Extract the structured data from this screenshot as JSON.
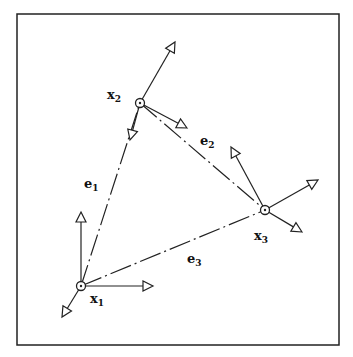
{
  "diagram": {
    "frame": {
      "x": 17,
      "y": 14,
      "w": 322,
      "h": 331
    },
    "nodes": [
      {
        "id": "x1",
        "label": "x",
        "sub": "1",
        "x": 81,
        "y": 286,
        "lx": 90,
        "ly": 303
      },
      {
        "id": "x2",
        "label": "x",
        "sub": "2",
        "x": 140,
        "y": 103,
        "lx": 107,
        "ly": 99
      },
      {
        "id": "x3",
        "label": "x",
        "sub": "3",
        "x": 265,
        "y": 210,
        "lx": 254,
        "ly": 240
      }
    ],
    "edges": [
      {
        "id": "e1",
        "label": "e",
        "sub": "1",
        "from": "x1",
        "to": "x2",
        "lx": 84,
        "ly": 188
      },
      {
        "id": "e2",
        "label": "e",
        "sub": "2",
        "from": "x2",
        "to": "x3",
        "lx": 200,
        "ly": 145
      },
      {
        "id": "e3",
        "label": "e",
        "sub": "3",
        "from": "x1",
        "to": "x3",
        "lx": 187,
        "ly": 263
      }
    ],
    "frames_axes": [
      {
        "node": "x1",
        "tips": [
          [
            81,
            212
          ],
          [
            153,
            286
          ],
          [
            62,
            317
          ]
        ]
      },
      {
        "node": "x2",
        "tips": [
          [
            175,
            42
          ],
          [
            187,
            128
          ],
          [
            130,
            140
          ]
        ]
      },
      {
        "node": "x3",
        "tips": [
          [
            231,
            147
          ],
          [
            318,
            180
          ],
          [
            302,
            232
          ]
        ]
      }
    ]
  }
}
